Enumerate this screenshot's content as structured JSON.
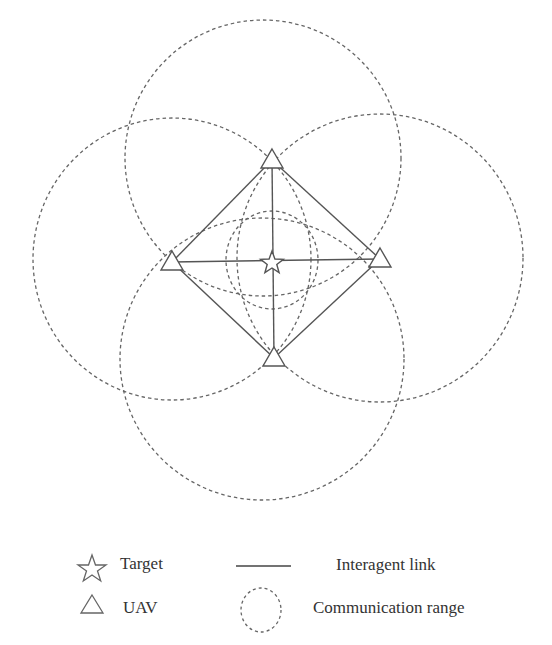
{
  "diagram": {
    "colors": {
      "stroke": "#555555",
      "dashed": "#666666",
      "text": "#333333"
    },
    "target": {
      "x": 272,
      "y": 263
    },
    "uavs": [
      {
        "id": "top",
        "x": 272,
        "y": 160
      },
      {
        "id": "left",
        "x": 172,
        "y": 262
      },
      {
        "id": "right",
        "x": 380,
        "y": 259
      },
      {
        "id": "bottom",
        "x": 274,
        "y": 358
      }
    ],
    "links": [
      [
        "top",
        "left"
      ],
      [
        "top",
        "right"
      ],
      [
        "bottom",
        "left"
      ],
      [
        "bottom",
        "right"
      ],
      [
        "top",
        "bottom"
      ],
      [
        "left",
        "right"
      ]
    ],
    "ranges": [
      {
        "cx": 263,
        "cy": 158,
        "rx": 138,
        "ry": 138
      },
      {
        "cx": 172,
        "cy": 259,
        "rx": 139,
        "ry": 141
      },
      {
        "cx": 380,
        "cy": 258,
        "rx": 143,
        "ry": 144
      },
      {
        "cx": 262,
        "cy": 359,
        "rx": 142,
        "ry": 141
      },
      {
        "cx": 272,
        "cy": 260,
        "rx": 46,
        "ry": 49
      }
    ]
  },
  "legend": {
    "target_label": "Target",
    "uav_label": "UAV",
    "link_label": "Interagent link",
    "range_label": "Communication range"
  }
}
